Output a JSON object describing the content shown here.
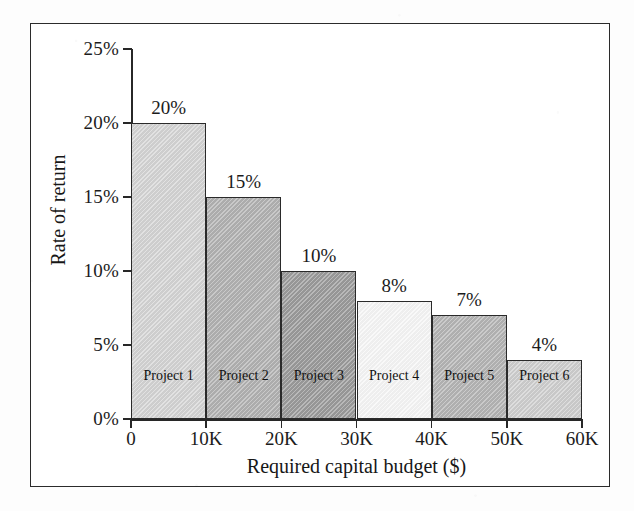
{
  "chart_data": {
    "type": "bar",
    "title": "",
    "xlabel": "Required capital budget ($)",
    "ylabel": "Rate of return",
    "categories": [
      "Project 1",
      "Project 2",
      "Project 3",
      "Project 4",
      "Project 5",
      "Project 6"
    ],
    "values": [
      20,
      15,
      10,
      8,
      7,
      4
    ],
    "value_labels": [
      "20%",
      "15%",
      "10%",
      "8%",
      "7%",
      "4%"
    ],
    "bar_spans_k": [
      [
        0,
        10
      ],
      [
        10,
        20
      ],
      [
        20,
        30
      ],
      [
        30,
        40
      ],
      [
        40,
        50
      ],
      [
        50,
        60
      ]
    ],
    "bar_fill_colors": [
      "#d5d5d5",
      "#b2b2b2",
      "#9b9b9b",
      "#f7f7f7",
      "#b5b5b5",
      "#cfcfcf"
    ],
    "bar_edge_color": "#2a2a2a",
    "ylim": [
      0,
      25
    ],
    "xlim_k": [
      0,
      60
    ],
    "ytick_labels": [
      "25%",
      "20%",
      "15%",
      "10%",
      "5%",
      "0%"
    ],
    "ytick_values": [
      25,
      20,
      15,
      10,
      5,
      0
    ],
    "xtick_labels": [
      "0",
      "10K",
      "20K",
      "30K",
      "40K",
      "50K",
      "60K"
    ],
    "xtick_values_k": [
      0,
      10,
      20,
      30,
      40,
      50,
      60
    ],
    "grid": false,
    "legend": false,
    "frame": true,
    "background_color": "#ffffff"
  }
}
